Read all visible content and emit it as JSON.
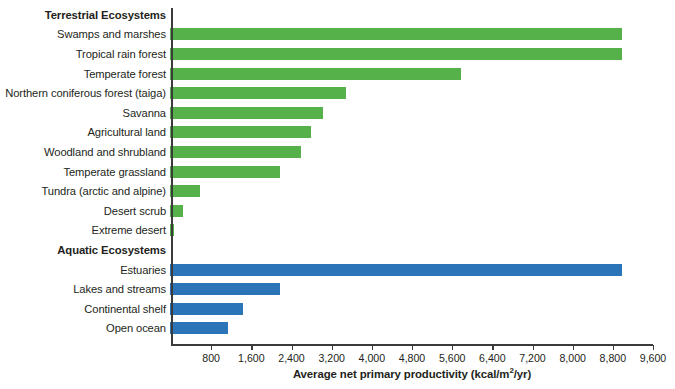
{
  "chart_data": {
    "type": "bar",
    "orientation": "horizontal",
    "title": "",
    "xlabel": "Average net primary productivity (kcal/m2/yr)",
    "xlabel_parts": {
      "before_sup": "Average net primary productivity (kcal/m",
      "sup": "2",
      "after_sup": "/yr)"
    },
    "ylabel": "",
    "xlim": [
      0,
      9600
    ],
    "xticks": [
      800,
      1600,
      2400,
      3200,
      4000,
      4800,
      5600,
      6400,
      7200,
      8000,
      8800,
      9600
    ],
    "xtick_labels": [
      "800",
      "1,600",
      "2,400",
      "3,200",
      "4,000",
      "4,800",
      "5,600",
      "6,400",
      "7,200",
      "8,000",
      "8,800",
      "9,600"
    ],
    "grid": false,
    "legend": "none",
    "groups": [
      {
        "name": "Terrestrial Ecosystems",
        "color": "#56b14b"
      },
      {
        "name": "Aquatic Ecosystems",
        "color": "#2b74b8"
      }
    ],
    "rows": [
      {
        "kind": "group",
        "label": "Terrestrial Ecosystems"
      },
      {
        "kind": "bar",
        "group": "terrestrial",
        "label": "Swamps and marshes",
        "value": 9000
      },
      {
        "kind": "bar",
        "group": "terrestrial",
        "label": "Tropical rain forest",
        "value": 9000
      },
      {
        "kind": "bar",
        "group": "terrestrial",
        "label": "Temperate forest",
        "value": 5800
      },
      {
        "kind": "bar",
        "group": "terrestrial",
        "label": "Northern coniferous forest (taiga)",
        "value": 3500
      },
      {
        "kind": "bar",
        "group": "terrestrial",
        "label": "Savanna",
        "value": 3050
      },
      {
        "kind": "bar",
        "group": "terrestrial",
        "label": "Agricultural land",
        "value": 2800
      },
      {
        "kind": "bar",
        "group": "terrestrial",
        "label": "Woodland and shrubland",
        "value": 2600
      },
      {
        "kind": "bar",
        "group": "terrestrial",
        "label": "Temperate grassland",
        "value": 2200
      },
      {
        "kind": "bar",
        "group": "terrestrial",
        "label": "Tundra (arctic and alpine)",
        "value": 600
      },
      {
        "kind": "bar",
        "group": "terrestrial",
        "label": "Desert scrub",
        "value": 250
      },
      {
        "kind": "bar",
        "group": "terrestrial",
        "label": "Extreme desert",
        "value": 80
      },
      {
        "kind": "group",
        "label": "Aquatic Ecosystems"
      },
      {
        "kind": "bar",
        "group": "aquatic",
        "label": "Estuaries",
        "value": 9000
      },
      {
        "kind": "bar",
        "group": "aquatic",
        "label": "Lakes and streams",
        "value": 2200
      },
      {
        "kind": "bar",
        "group": "aquatic",
        "label": "Continental shelf",
        "value": 1450
      },
      {
        "kind": "bar",
        "group": "aquatic",
        "label": "Open ocean",
        "value": 1150
      }
    ]
  }
}
